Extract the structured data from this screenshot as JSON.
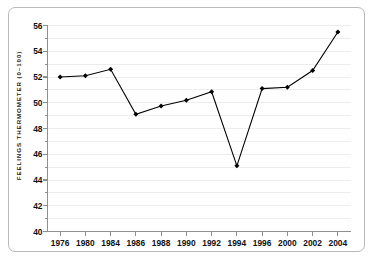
{
  "chart_data": {
    "type": "line",
    "title": "",
    "xlabel": "",
    "ylabel": "FEELINGS THERMOMETER (0–100)",
    "categories": [
      "1976",
      "1980",
      "1984",
      "1986",
      "1988",
      "1990",
      "1992",
      "1994",
      "1996",
      "2000",
      "2002",
      "2004"
    ],
    "values": [
      52.0,
      52.1,
      52.6,
      49.1,
      49.75,
      50.2,
      50.85,
      45.1,
      51.1,
      51.2,
      52.5,
      55.5
    ],
    "ylim": [
      40,
      56
    ],
    "ytick_labels": [
      "40",
      "42",
      "44",
      "46",
      "48",
      "50",
      "52",
      "54",
      "56"
    ],
    "ytick_values": [
      40,
      42,
      44,
      46,
      48,
      50,
      52,
      54,
      56
    ],
    "yminor_step": 1,
    "grid": true,
    "legend": "none",
    "series_color": "#000000",
    "grid_color": "#ededed",
    "axis_color": "#8f8f8f",
    "frame_color": "#b9b9b9",
    "marker": "diamond"
  }
}
